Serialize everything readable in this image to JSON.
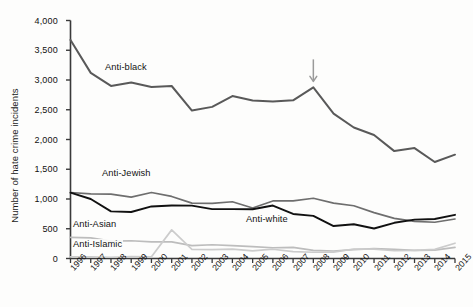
{
  "figure": {
    "caption": ""
  },
  "axes": {
    "ylabel": "Number of hate crime incidents",
    "yticks": [
      "0",
      "500",
      "1,000",
      "1,500",
      "2,000",
      "2,500",
      "3,000",
      "3,500",
      "4,000"
    ],
    "xticks": [
      "1996",
      "1997",
      "1998",
      "1999",
      "2000",
      "2001",
      "2002",
      "2003",
      "2004",
      "2005",
      "2006",
      "2007",
      "2008",
      "2009",
      "2010",
      "2011",
      "2012",
      "2013",
      "2014",
      "2015"
    ]
  },
  "annotation": {
    "arrow_year": "2008",
    "arrow_color": "#9a9a9a"
  },
  "series_labels": {
    "anti_black": "Anti-black",
    "anti_jewish": "Anti-Jewish",
    "anti_white": "Anti-white",
    "anti_asian": "Anti-Asian",
    "anti_islamic": "Anti-Islamic"
  },
  "chart_data": {
    "type": "line",
    "title": "",
    "xlabel": "",
    "ylabel": "Number of hate crime incidents",
    "xlim": [
      1996,
      2015
    ],
    "ylim": [
      0,
      4000
    ],
    "ytick_step": 500,
    "grid": false,
    "legend": "inline-labels",
    "x": [
      1996,
      1997,
      1998,
      1999,
      2000,
      2001,
      2002,
      2003,
      2004,
      2005,
      2006,
      2007,
      2008,
      2009,
      2010,
      2011,
      2012,
      2013,
      2014,
      2015
    ],
    "series": [
      {
        "name": "Anti-black",
        "color": "#595959",
        "width": 2.0,
        "values": [
          3674,
          3120,
          2901,
          2958,
          2884,
          2899,
          2486,
          2548,
          2731,
          2657,
          2640,
          2659,
          2876,
          2436,
          2201,
          2076,
          1805,
          1856,
          1621,
          1745
        ]
      },
      {
        "name": "Anti-Jewish",
        "color": "#6e6e6e",
        "width": 1.7,
        "values": [
          1109,
          1087,
          1081,
          1032,
          1109,
          1043,
          931,
          927,
          954,
          848,
          967,
          969,
          1013,
          931,
          887,
          771,
          674,
          625,
          609,
          664
        ]
      },
      {
        "name": "Anti-white",
        "color": "#111111",
        "width": 1.9,
        "values": [
          1106,
          1000,
          792,
          781,
          875,
          891,
          888,
          830,
          829,
          828,
          890,
          749,
          716,
          545,
          575,
          504,
          600,
          653,
          663,
          734
        ]
      },
      {
        "name": "Anti-Asian",
        "color": "#bdbdbd",
        "width": 1.7,
        "values": [
          355,
          347,
          293,
          298,
          281,
          280,
          217,
          231,
          217,
          199,
          181,
          188,
          137,
          126,
          150,
          165,
          153,
          135,
          140,
          188
        ]
      },
      {
        "name": "Anti-Islamic",
        "color": "#cccccc",
        "width": 1.7,
        "values": [
          27,
          28,
          21,
          32,
          28,
          481,
          155,
          149,
          156,
          128,
          156,
          115,
          105,
          107,
          160,
          157,
          130,
          135,
          154,
          257
        ]
      }
    ],
    "annotations": [
      {
        "type": "arrow",
        "x": 2008,
        "direction": "down",
        "target_series": "Anti-black",
        "color": "#9a9a9a"
      }
    ]
  }
}
